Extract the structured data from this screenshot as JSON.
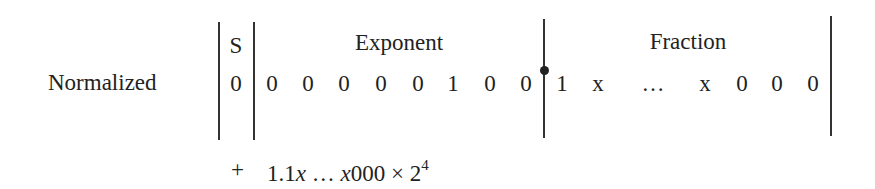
{
  "row_label": "Normalized",
  "fields": {
    "sign": {
      "header": "S",
      "bits": [
        "0"
      ]
    },
    "exponent": {
      "header": "Exponent",
      "bits": [
        "0",
        "0",
        "0",
        "0",
        "0",
        "1",
        "0",
        "0"
      ]
    },
    "fraction": {
      "header": "Fraction",
      "bits": [
        "1",
        "x",
        "…",
        "x",
        "0",
        "0",
        "0"
      ]
    }
  },
  "value": {
    "sign_symbol": "+",
    "mantissa_a": "1.1",
    "x1": "x",
    "ellipsis": " … ",
    "x2": "x",
    "tail": "000 × 2",
    "exponent": "4"
  }
}
